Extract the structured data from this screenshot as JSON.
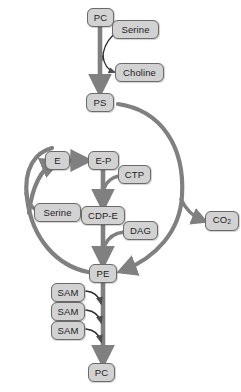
{
  "diagram": {
    "colors": {
      "node_fill": "#d2d2d2",
      "node_stroke": "#6b6b6b",
      "arrow": "#808080",
      "background": "#ffffff",
      "text": "#222222"
    },
    "nodes": [
      {
        "id": "pc-top",
        "label": "PC",
        "x": 87,
        "y": 8,
        "w": 27,
        "h": 19
      },
      {
        "id": "serine-top",
        "label": "Serine",
        "x": 112,
        "y": 20,
        "w": 47,
        "h": 19
      },
      {
        "id": "choline",
        "label": "Choline",
        "x": 115,
        "y": 63,
        "w": 49,
        "h": 19
      },
      {
        "id": "ps",
        "label": "PS",
        "x": 86,
        "y": 93,
        "w": 28,
        "h": 19
      },
      {
        "id": "e",
        "label": "E",
        "x": 45,
        "y": 151,
        "w": 25,
        "h": 19
      },
      {
        "id": "ep",
        "label": "E-P",
        "x": 88,
        "y": 151,
        "w": 31,
        "h": 19
      },
      {
        "id": "ctp",
        "label": "CTP",
        "x": 118,
        "y": 165,
        "w": 33,
        "h": 19
      },
      {
        "id": "serine-mid",
        "label": "Serine",
        "x": 34,
        "y": 203,
        "w": 47,
        "h": 19
      },
      {
        "id": "cdp-e",
        "label": "CDP-E",
        "x": 81,
        "y": 206,
        "w": 44,
        "h": 19
      },
      {
        "id": "dag",
        "label": "DAG",
        "x": 123,
        "y": 221,
        "w": 35,
        "h": 19
      },
      {
        "id": "co2",
        "label": "CO",
        "sub": "2",
        "x": 205,
        "y": 211,
        "w": 34,
        "h": 20
      },
      {
        "id": "pe",
        "label": "PE",
        "x": 89,
        "y": 264,
        "w": 28,
        "h": 19
      },
      {
        "id": "sam-1",
        "label": "SAM",
        "x": 51,
        "y": 283,
        "w": 34,
        "h": 19
      },
      {
        "id": "sam-2",
        "label": "SAM",
        "x": 51,
        "y": 302,
        "w": 34,
        "h": 19
      },
      {
        "id": "sam-3",
        "label": "SAM",
        "x": 51,
        "y": 321,
        "w": 34,
        "h": 19
      },
      {
        "id": "pc-bottom",
        "label": "PC",
        "x": 88,
        "y": 363,
        "w": 27,
        "h": 19
      }
    ],
    "edges": [
      {
        "id": "pc-to-ps",
        "from": "pc-top",
        "to": "ps",
        "kind": "straight-thick"
      },
      {
        "id": "serine-in",
        "from": "serine-top",
        "to": "pc-to-ps",
        "kind": "curved-thin"
      },
      {
        "id": "choline-out",
        "from": "pc-to-ps",
        "to": "choline",
        "kind": "curved-thin"
      },
      {
        "id": "ps-to-co2-arc",
        "from": "ps",
        "to": "co2",
        "kind": "arc-right"
      },
      {
        "id": "arc-to-pe",
        "from": "ps",
        "to": "pe",
        "kind": "arc-right-down"
      },
      {
        "id": "pe-to-serine-arc",
        "from": "pe",
        "to": "e",
        "kind": "arc-left-up"
      },
      {
        "id": "serine-mid-in",
        "from": "serine-mid",
        "to": "arc-left",
        "kind": "curved-thin"
      },
      {
        "id": "e-to-ep",
        "from": "e",
        "to": "ep",
        "kind": "straight-thick"
      },
      {
        "id": "ep-to-cdpe",
        "from": "ep",
        "to": "cdp-e",
        "kind": "straight-thick"
      },
      {
        "id": "ctp-in",
        "from": "ctp",
        "to": "ep-to-cdpe",
        "kind": "curved-thin"
      },
      {
        "id": "cdpe-to-pe",
        "from": "cdp-e",
        "to": "pe",
        "kind": "straight-thick"
      },
      {
        "id": "dag-in",
        "from": "dag",
        "to": "cdpe-to-pe",
        "kind": "curved-thin"
      },
      {
        "id": "pe-to-pc",
        "from": "pe",
        "to": "pc-bottom",
        "kind": "straight-thick"
      },
      {
        "id": "sam-1-in",
        "from": "sam-1",
        "to": "pe-to-pc",
        "kind": "curved-thin"
      },
      {
        "id": "sam-2-in",
        "from": "sam-2",
        "to": "pe-to-pc",
        "kind": "curved-thin"
      },
      {
        "id": "sam-3-in",
        "from": "sam-3",
        "to": "pe-to-pc",
        "kind": "curved-thin"
      }
    ]
  }
}
